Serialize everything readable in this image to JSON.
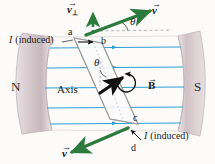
{
  "figure": {
    "background_color": "#fcfbfa"
  },
  "poles": {
    "north_label": "N",
    "south_label": "S",
    "pole_color": "#cfc3c6",
    "pole_highlight": "#efe7e8"
  },
  "field": {
    "vector_label": "B",
    "line_color": "#2f9fd6",
    "line_count": 5,
    "direction": "left-to-right"
  },
  "loop": {
    "corner_a": "a",
    "corner_b": "b",
    "corner_c": "c",
    "corner_d": "d",
    "axis_label": "Axis",
    "wire_color": "#8e8e8e",
    "fill_color": "#fbfbfb"
  },
  "angles": {
    "theta_top": "θ",
    "theta_inner": "θ"
  },
  "velocity": {
    "v_top_label": "v",
    "v_perp_label": "v",
    "v_perp_subscript": "⊥",
    "v_bottom_label": "v",
    "arrow_color": "#2d7a3e",
    "dashed_color": "#2d7a3e"
  },
  "current": {
    "top_label_symbol": "I",
    "top_label_text": "(induced)",
    "bottom_label_symbol": "I",
    "bottom_label_text": "(induced)",
    "arrow_color": "#111111"
  },
  "normal_arrow": {
    "name": "magnetic-moment-arrow",
    "color": "#101010",
    "rotation_indicator": "curved-arrow"
  }
}
